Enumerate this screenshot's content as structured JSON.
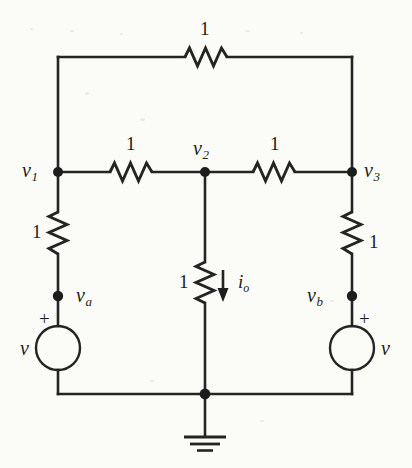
{
  "diagram": {
    "background_color": "#fbfbf8",
    "line_color": "#242424"
  },
  "resistors": [
    {
      "id": "r-top",
      "label": "1",
      "orientation": "horizontal"
    },
    {
      "id": "r-left-mid",
      "label": "1",
      "orientation": "horizontal"
    },
    {
      "id": "r-right-mid",
      "label": "1",
      "orientation": "horizontal"
    },
    {
      "id": "r-left-vert",
      "label": "1",
      "orientation": "vertical"
    },
    {
      "id": "r-center-vert",
      "label": "1",
      "orientation": "vertical"
    },
    {
      "id": "r-right-vert",
      "label": "1",
      "orientation": "vertical"
    }
  ],
  "nodes": [
    {
      "id": "node-v1",
      "label": "v",
      "subscript": "1"
    },
    {
      "id": "node-v2",
      "label": "v",
      "subscript": "2"
    },
    {
      "id": "node-v3",
      "label": "v",
      "subscript": "3"
    },
    {
      "id": "node-va",
      "label": "v",
      "subscript": "a"
    },
    {
      "id": "node-vb",
      "label": "v",
      "subscript": "b"
    }
  ],
  "sources": [
    {
      "id": "source-left",
      "label": "v",
      "polarity": "+"
    },
    {
      "id": "source-right",
      "label": "v",
      "polarity": "+"
    }
  ],
  "current": {
    "id": "current-io",
    "label": "i",
    "subscript": "o",
    "direction": "down"
  },
  "ground": {
    "id": "ground-symbol",
    "label": ""
  }
}
